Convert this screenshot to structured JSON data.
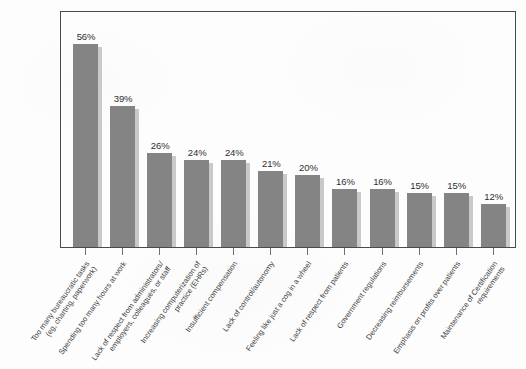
{
  "chart_data": {
    "type": "bar",
    "title": "",
    "subtitle": "",
    "xlabel": "",
    "ylabel": "",
    "ylim": [
      0,
      60
    ],
    "grid": false,
    "legend": "none",
    "value_suffix": "%",
    "categories": [
      "Too many bureaucratic tasks (eg, charting, paperwork)",
      "Spending too many hours at work",
      "Lack of respect from administrators/ employers, colleagues, or staff",
      "Increasing computerization of practice (EHRs)",
      "Insufficient compensation",
      "Lack of control/autonomy",
      "Feeling like just a cog in a wheel",
      "Lack of respect from patients",
      "Government regulations",
      "Decreasing reimbursements",
      "Emphasis on profits over patients",
      "Maintenance of Certification requirements"
    ],
    "category_lines": [
      [
        "Too many bureaucratic tasks",
        "(eg, charting, paperwork)"
      ],
      [
        "Spending too many hours at work",
        ""
      ],
      [
        "Lack of respect from administrators/",
        "employers, colleagues, or staff"
      ],
      [
        "Increasing computerization of",
        "practice (EHRs)"
      ],
      [
        "Insufficient compensation",
        ""
      ],
      [
        "Lack of control/autonomy",
        ""
      ],
      [
        "Feeling like just a cog in a wheel",
        ""
      ],
      [
        "Lack of respect from patients",
        ""
      ],
      [
        "Government regulations",
        ""
      ],
      [
        "Decreasing reimbursements",
        ""
      ],
      [
        "Emphasis on profits over patients",
        ""
      ],
      [
        "Maintenance of Certification",
        "requirements"
      ]
    ],
    "values": [
      56,
      39,
      26,
      24,
      24,
      21,
      20,
      16,
      16,
      15,
      15,
      12
    ],
    "value_labels": [
      "56%",
      "39%",
      "26%",
      "24%",
      "24%",
      "21%",
      "20%",
      "16%",
      "16%",
      "15%",
      "15%",
      "12%"
    ],
    "colors": {
      "bar_fill": "#848484",
      "bar_shadow": "#c9c9c9",
      "frame": "#4a4a4a",
      "text": "#3b3b3b",
      "background": "#fdfdfd"
    }
  }
}
